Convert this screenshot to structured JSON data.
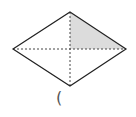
{
  "diagram": {
    "shape": "rhombus",
    "vertices": {
      "top": [
        70,
        12
      ],
      "left": [
        13,
        49
      ],
      "right": [
        126,
        49
      ],
      "bottom": [
        70,
        86
      ]
    },
    "center": [
      70,
      49
    ],
    "diagonals": "dashed",
    "shaded_region": "top-right triangle",
    "colors": {
      "outline": "#222222",
      "diagonal": "#444444",
      "shade": "#dcdcdc"
    }
  },
  "answer": {
    "bracket": "("
  }
}
